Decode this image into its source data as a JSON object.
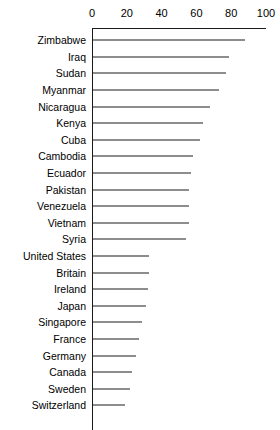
{
  "chart_data": {
    "type": "bar",
    "orientation": "horizontal",
    "title": "",
    "subtitle": "",
    "xlabel": "",
    "ylabel": "",
    "xlim": [
      0,
      100
    ],
    "ylim": null,
    "grid": false,
    "legend": null,
    "legend_position": "none",
    "axis_position": "top",
    "xticks": [
      0,
      20,
      40,
      60,
      80,
      100
    ],
    "xtick_labels": [
      "0",
      "20",
      "40",
      "60",
      "80",
      "100"
    ],
    "categories": [
      "Zimbabwe",
      "Iraq",
      "Sudan",
      "Myanmar",
      "Nicaragua",
      "Kenya",
      "Cuba",
      "Cambodia",
      "Ecuador",
      "Pakistan",
      "Venezuela",
      "Vietnam",
      "Syria",
      "United States",
      "Britain",
      "Ireland",
      "Japan",
      "Singapore",
      "France",
      "Germany",
      "Canada",
      "Sweden",
      "Switzerland"
    ],
    "values": [
      88,
      79,
      77,
      73,
      68,
      64,
      62,
      58,
      57,
      56,
      56,
      56,
      54,
      33,
      33,
      32,
      31,
      29,
      27,
      25,
      23,
      22,
      19
    ]
  },
  "style": {
    "bar_color": "#1c1c1c",
    "axis_color": "#1a1a1a",
    "background": "#ffffff",
    "text_color": "#000000"
  }
}
